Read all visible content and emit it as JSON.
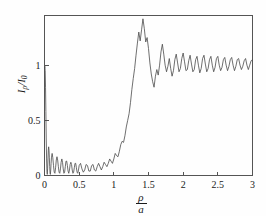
{
  "figure": {
    "background_color": "#fefefe",
    "axis_color": "#555555",
    "curve_color": "#4a4a4a"
  },
  "axes": {
    "ylabel_numerator_symbol": "I",
    "ylabel_numerator_subscript": "ρ",
    "ylabel_divider": "/",
    "ylabel_denominator_symbol": "I",
    "ylabel_denominator_subscript": "0",
    "xlabel_numerator": "ρ",
    "xlabel_denominator": "a",
    "xtick_labels": [
      "0",
      "0.5",
      "1",
      "1.5",
      "2",
      "2.5",
      "3"
    ],
    "ytick_labels": [
      "0",
      "0.5",
      "1"
    ]
  },
  "chart_data": {
    "type": "line",
    "title": "",
    "xlabel": "ρ/a",
    "ylabel": "Iρ/I0",
    "xlim": [
      0,
      3
    ],
    "ylim": [
      0,
      1.45
    ],
    "xticks": [
      0,
      0.5,
      1,
      1.5,
      2,
      2.5,
      3
    ],
    "yticks": [
      0,
      0.5,
      1
    ],
    "grid": false,
    "legend": "none",
    "series": [
      {
        "name": "I_rho / I_0",
        "x": [
          0.0,
          0.005,
          0.01,
          0.015,
          0.02,
          0.025,
          0.03,
          0.035,
          0.04,
          0.045,
          0.05,
          0.055,
          0.06,
          0.065,
          0.07,
          0.075,
          0.08,
          0.085,
          0.09,
          0.095,
          0.1,
          0.11,
          0.12,
          0.13,
          0.14,
          0.15,
          0.16,
          0.17,
          0.18,
          0.19,
          0.2,
          0.21,
          0.22,
          0.23,
          0.24,
          0.25,
          0.26,
          0.27,
          0.28,
          0.29,
          0.3,
          0.31,
          0.32,
          0.33,
          0.34,
          0.35,
          0.36,
          0.37,
          0.38,
          0.39,
          0.4,
          0.41,
          0.42,
          0.43,
          0.44,
          0.45,
          0.46,
          0.47,
          0.48,
          0.49,
          0.5,
          0.52,
          0.54,
          0.56,
          0.58,
          0.6,
          0.62,
          0.64,
          0.66,
          0.68,
          0.7,
          0.72,
          0.74,
          0.76,
          0.78,
          0.8,
          0.82,
          0.84,
          0.86,
          0.88,
          0.9,
          0.92,
          0.94,
          0.96,
          0.98,
          1.0,
          1.02,
          1.04,
          1.06,
          1.08,
          1.1,
          1.12,
          1.14,
          1.16,
          1.18,
          1.2,
          1.22,
          1.24,
          1.26,
          1.28,
          1.3,
          1.32,
          1.34,
          1.36,
          1.38,
          1.4,
          1.42,
          1.44,
          1.46,
          1.48,
          1.5,
          1.52,
          1.54,
          1.56,
          1.58,
          1.6,
          1.62,
          1.64,
          1.66,
          1.68,
          1.7,
          1.72,
          1.74,
          1.76,
          1.78,
          1.8,
          1.82,
          1.84,
          1.86,
          1.88,
          1.9,
          1.92,
          1.94,
          1.96,
          1.98,
          2.0,
          2.02,
          2.04,
          2.06,
          2.08,
          2.1,
          2.12,
          2.14,
          2.16,
          2.18,
          2.2,
          2.22,
          2.24,
          2.26,
          2.28,
          2.3,
          2.32,
          2.34,
          2.36,
          2.38,
          2.4,
          2.42,
          2.44,
          2.46,
          2.48,
          2.5,
          2.52,
          2.54,
          2.56,
          2.58,
          2.6,
          2.62,
          2.64,
          2.66,
          2.68,
          2.7,
          2.72,
          2.74,
          2.76,
          2.78,
          2.8,
          2.82,
          2.84,
          2.86,
          2.88,
          2.9,
          2.92,
          2.94,
          2.96,
          2.98,
          3.0
        ],
        "y": [
          0.97,
          0.99,
          0.95,
          0.8,
          0.58,
          0.34,
          0.15,
          0.04,
          0.01,
          0.06,
          0.15,
          0.23,
          0.26,
          0.23,
          0.16,
          0.08,
          0.02,
          0.01,
          0.05,
          0.11,
          0.16,
          0.2,
          0.16,
          0.09,
          0.03,
          0.02,
          0.07,
          0.14,
          0.17,
          0.14,
          0.08,
          0.03,
          0.02,
          0.06,
          0.12,
          0.15,
          0.12,
          0.06,
          0.02,
          0.03,
          0.08,
          0.13,
          0.13,
          0.09,
          0.04,
          0.02,
          0.05,
          0.1,
          0.12,
          0.1,
          0.05,
          0.02,
          0.03,
          0.07,
          0.11,
          0.11,
          0.07,
          0.03,
          0.02,
          0.05,
          0.09,
          0.11,
          0.06,
          0.03,
          0.05,
          0.1,
          0.09,
          0.04,
          0.04,
          0.09,
          0.1,
          0.05,
          0.04,
          0.08,
          0.11,
          0.08,
          0.05,
          0.08,
          0.12,
          0.1,
          0.08,
          0.11,
          0.15,
          0.13,
          0.11,
          0.15,
          0.2,
          0.18,
          0.17,
          0.22,
          0.28,
          0.31,
          0.3,
          0.36,
          0.44,
          0.5,
          0.56,
          0.66,
          0.78,
          0.88,
          0.97,
          1.09,
          1.2,
          1.3,
          1.22,
          1.32,
          1.42,
          1.33,
          1.21,
          1.25,
          1.15,
          1.02,
          0.92,
          0.85,
          0.8,
          0.9,
          0.96,
          0.91,
          1.0,
          1.12,
          1.19,
          1.1,
          1.0,
          0.94,
          0.99,
          1.06,
          0.97,
          0.9,
          0.95,
          1.05,
          1.1,
          1.02,
          0.94,
          0.97,
          1.06,
          1.11,
          1.03,
          0.95,
          0.96,
          1.04,
          1.09,
          1.01,
          0.94,
          0.96,
          1.05,
          1.08,
          1.0,
          0.93,
          0.97,
          1.06,
          1.09,
          1.01,
          0.94,
          0.97,
          1.05,
          1.08,
          1.0,
          0.94,
          0.98,
          1.06,
          1.08,
          1.0,
          0.95,
          0.98,
          1.05,
          1.07,
          1.0,
          0.95,
          0.99,
          1.05,
          1.07,
          1.0,
          0.95,
          0.99,
          1.05,
          1.06,
          1.0,
          0.96,
          0.99,
          1.04,
          1.06,
          1.0,
          0.96,
          1.0,
          1.04,
          1.05
        ]
      }
    ]
  }
}
